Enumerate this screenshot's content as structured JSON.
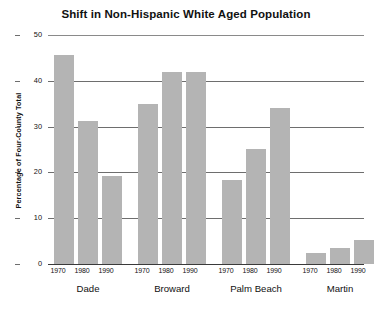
{
  "chart_data": {
    "type": "bar",
    "title": "Shift in Non-Hispanic White Aged Population",
    "xlabel": "",
    "ylabel": "Percentage of Four-County Total",
    "ylim": [
      0,
      50
    ],
    "yticks": [
      0,
      10,
      20,
      30,
      40,
      50
    ],
    "ytick_labels": [
      "0",
      "10",
      "20",
      "30",
      "40",
      "50"
    ],
    "grid": true,
    "legend": "none",
    "groups": [
      "Dade",
      "Broward",
      "Palm Beach",
      "Martin"
    ],
    "categories": [
      "1970",
      "1980",
      "1990"
    ],
    "series": [
      {
        "name": "Dade",
        "values": [
          45.6,
          31.3,
          19.2
        ]
      },
      {
        "name": "Broward",
        "values": [
          35.0,
          42.0,
          42.0
        ]
      },
      {
        "name": "Palm Beach",
        "values": [
          18.3,
          25.2,
          34.0
        ]
      },
      {
        "name": "Martin",
        "values": [
          2.5,
          3.5,
          5.2
        ]
      }
    ],
    "bar_color": "#b4b4b4",
    "axis_color": "#3a3a3a",
    "grid_color": "#6e6e6e",
    "background": "#ffffff"
  },
  "bars": [
    {
      "group": "Dade",
      "year": "1970",
      "value": 45.6
    },
    {
      "group": "Dade",
      "year": "1980",
      "value": 31.3
    },
    {
      "group": "Dade",
      "year": "1990",
      "value": 19.2
    },
    {
      "group": "Broward",
      "year": "1970",
      "value": 35.0
    },
    {
      "group": "Broward",
      "year": "1980",
      "value": 42.0
    },
    {
      "group": "Broward",
      "year": "1990",
      "value": 42.0
    },
    {
      "group": "Palm Beach",
      "year": "1970",
      "value": 18.3
    },
    {
      "group": "Palm Beach",
      "year": "1980",
      "value": 25.2
    },
    {
      "group": "Palm Beach",
      "year": "1990",
      "value": 34.0
    },
    {
      "group": "Martin",
      "year": "1970",
      "value": 2.5
    },
    {
      "group": "Martin",
      "year": "1980",
      "value": 3.5
    },
    {
      "group": "Martin",
      "year": "1990",
      "value": 5.2
    }
  ],
  "axis": {
    "y_labels": [
      "50",
      "40",
      "30",
      "20",
      "10",
      "0"
    ],
    "year_labels": [
      "1970",
      "1980",
      "1990",
      "1970",
      "1980",
      "1990",
      "1970",
      "1980",
      "1990",
      "1970",
      "1980",
      "1990"
    ],
    "group_labels": [
      "Dade",
      "Broward",
      "Palm Beach",
      "Martin"
    ]
  }
}
